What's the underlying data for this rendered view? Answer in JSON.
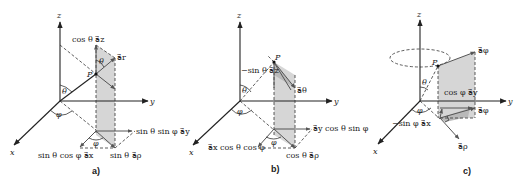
{
  "figure": {
    "panels": [
      {
        "id": "a",
        "caption": "a)",
        "axes": {
          "x": "x",
          "y": "y",
          "z": "z"
        },
        "point": "P",
        "angles": {
          "theta": "θ",
          "phi": "φ",
          "theta_at_p": "θ",
          "phi_at_base": "φ"
        },
        "labels": {
          "cos_theta_az": "cos θ a⃗z",
          "ar": "a⃗r",
          "sin_theta_sin_phi_ay": "sin θ sin φ a⃗y",
          "sin_theta_cos_phi_ax": "sin θ cos φ a⃗x",
          "sin_theta_arho": "sin θ a⃗ρ"
        }
      },
      {
        "id": "b",
        "caption": "b)",
        "axes": {
          "x": "x",
          "y": "y",
          "z": "z"
        },
        "point": "P",
        "angles": {
          "theta": "θ",
          "phi": "φ",
          "phi_at_base": "φ"
        },
        "labels": {
          "neg_sin_theta_az": "−sin θ a⃗z",
          "atheta": "a⃗θ",
          "ay_cos_theta_sin_phi": "a⃗y cos θ sin φ",
          "ax_cos_theta_cos_phi": "a⃗x cos θ cos φ",
          "cos_theta_arho": "cos θ a⃗ρ"
        }
      },
      {
        "id": "c",
        "caption": "c)",
        "axes": {
          "x": "x",
          "y": "y",
          "z": "z"
        },
        "point": "P",
        "angles": {
          "theta": "θ",
          "phi": "φ"
        },
        "labels": {
          "aphi_top": "a⃗φ",
          "cos_phi_ay": "cos φ a⃗y",
          "aphi": "a⃗φ",
          "neg_sin_phi_ax": "−sin φ a⃗x",
          "arho": "a⃗ρ"
        }
      }
    ]
  }
}
